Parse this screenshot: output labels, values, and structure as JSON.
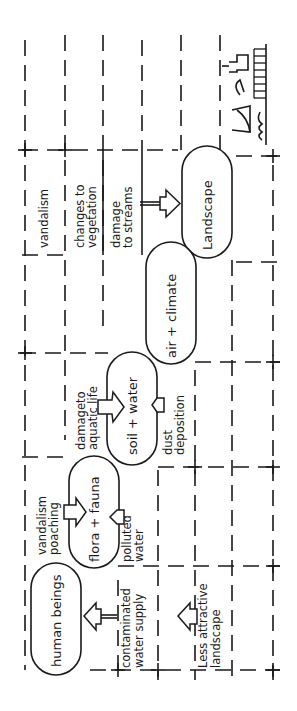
{
  "diagram": {
    "orientation": "rotated-90-ccw",
    "nodes": [
      {
        "id": "human",
        "label": "human beings"
      },
      {
        "id": "flora",
        "label": "flora + fauna"
      },
      {
        "id": "soil",
        "label": "soil + water"
      },
      {
        "id": "air",
        "label": "air + climate"
      },
      {
        "id": "landscape",
        "label": "Landscape"
      }
    ],
    "impacts": [
      {
        "id": "vandalism_top",
        "label": "vandalism"
      },
      {
        "id": "veg_1",
        "label": "changes to"
      },
      {
        "id": "veg_2",
        "label": "vegetation"
      },
      {
        "id": "streams_1",
        "label": "damage"
      },
      {
        "id": "streams_2",
        "label": "to streams"
      },
      {
        "id": "aquatic_1",
        "label": "damageto"
      },
      {
        "id": "aquatic_2",
        "label": "aquatic life"
      },
      {
        "id": "dust_1",
        "label": "dust"
      },
      {
        "id": "dust_2",
        "label": "deposition"
      },
      {
        "id": "poach_1",
        "label": "vandalism"
      },
      {
        "id": "poach_2",
        "label": "poaching"
      },
      {
        "id": "polluted_1",
        "label": "polluted"
      },
      {
        "id": "polluted_2",
        "label": "water"
      },
      {
        "id": "contam_1",
        "label": "contaminated"
      },
      {
        "id": "contam_2",
        "label": "water supply"
      },
      {
        "id": "attract_1",
        "label": "Less attractive"
      },
      {
        "id": "attract_2",
        "label": "landscape"
      }
    ],
    "sketch": "industrial-site-sketch"
  }
}
